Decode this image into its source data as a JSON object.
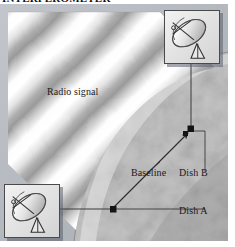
{
  "figure": {
    "title": "INTERFEROMETER",
    "domain": "astronomy-diagram"
  },
  "labels": {
    "radio_signal": "Radio signal",
    "baseline": "Baseline",
    "dish_b": "Dish B",
    "dish_a": "Dish A"
  },
  "icons": {
    "dish_top_right": "radio-telescope-dish-icon",
    "dish_bottom_left": "radio-telescope-dish-icon"
  },
  "colors": {
    "background": "#ffffff",
    "text": "#1a1a1a",
    "line": "#3a3a3a",
    "marker": "#1c1c1c",
    "panel_border": "#4a4a4a",
    "inset_fill": "#e9e9e9",
    "wave_light": "#ffffff",
    "wave_dark": "#b4b4b4",
    "planet_light": "#d2d2d2",
    "planet_dark": "#8e8e8e",
    "sky": "#b9bcc2"
  },
  "markers": [
    {
      "name": "dish-b-marker",
      "x": 191,
      "y": 125
    },
    {
      "name": "dish-a-marker",
      "x": 113,
      "y": 205
    }
  ]
}
